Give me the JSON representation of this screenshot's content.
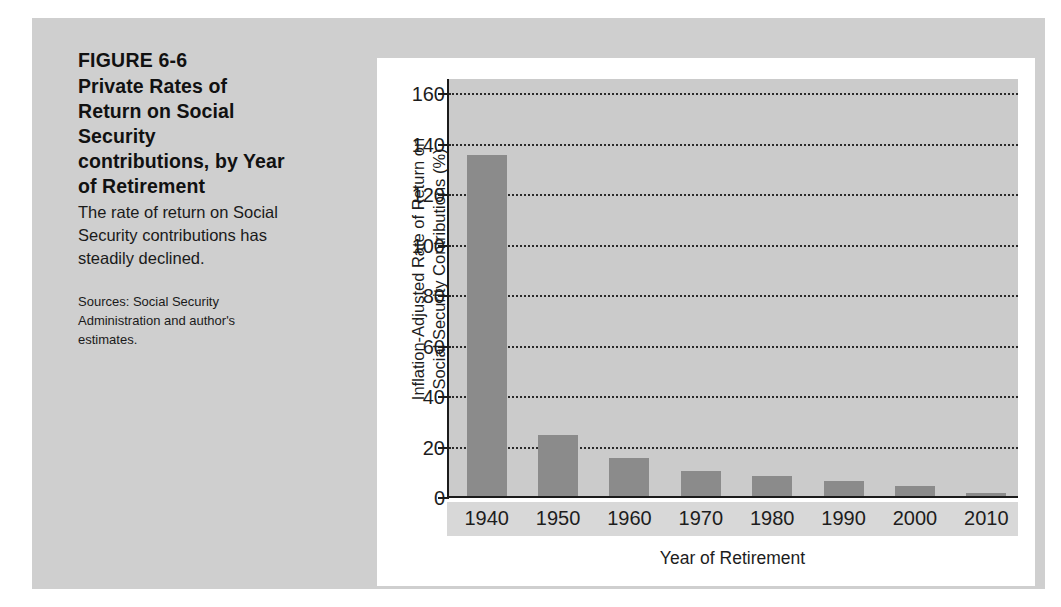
{
  "caption": {
    "figure_number": "FIGURE 6-6",
    "title": "Private Rates of Return on Social Security contributions, by Year of Retirement",
    "description": "The rate of return on Social Security contributions has steadily declined.",
    "sources": "Sources: Social Security Administration and author's estimates."
  },
  "colors": {
    "page_background": "#cfcfcf",
    "panel_background": "#ffffff",
    "plot_background": "#cbcbcb",
    "bar": "#8b8b8b",
    "axis": "#1b1b1b",
    "gridline": "#2a2a2a",
    "tick_band": "#d8d8d8",
    "text": "#1d1d1d"
  },
  "chart_data": {
    "type": "bar",
    "title": "Private Rates of Return on Social Security contributions, by Year of Retirement",
    "xlabel": "Year of Retirement",
    "ylabel": "Inflation-Adjusted Rate of Return on\nSocial Security Contributions (%)",
    "categories": [
      "1940",
      "1950",
      "1960",
      "1970",
      "1980",
      "1990",
      "2000",
      "2010"
    ],
    "values": [
      135,
      24,
      15,
      10,
      8,
      6,
      4,
      1
    ],
    "ylim": [
      0,
      166
    ],
    "yticks": [
      0,
      20,
      40,
      60,
      80,
      100,
      120,
      140,
      160
    ],
    "ytick_labels": [
      "0",
      "20",
      "40",
      "60",
      "80",
      "100",
      "120",
      "140",
      "160"
    ],
    "grid": true,
    "grid_axis": "y",
    "grid_style": "dotted",
    "legend": false
  }
}
